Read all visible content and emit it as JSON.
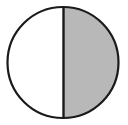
{
  "figure": {
    "kind": "geometry-diagram",
    "name": "circle-half-shaded",
    "description": "A circle divided by a vertical diameter into two equal halves; the right half is shaded gray and the left half is unshaded white.",
    "canvas": {
      "width": 128,
      "height": 125,
      "background_color": "#ffffff"
    },
    "circle": {
      "center_x": 63,
      "center_y": 62.5,
      "radius": 55.5,
      "diameter": 111,
      "outline_color": "#1a1a1a",
      "outline_width": 2.2,
      "fill_color": "#ffffff"
    },
    "divider": {
      "orientation": "vertical",
      "x": 63.5,
      "y_top": 7,
      "y_bottom": 118,
      "color": "#1a1a1a",
      "width": 2.4
    },
    "regions": [
      {
        "label": "left half",
        "position": "left",
        "shaded": "no",
        "fill_color": "#ffffff",
        "fraction": "1/2"
      },
      {
        "label": "right half",
        "position": "right",
        "shaded": "yes",
        "fill_color": "#b8b8b8",
        "fraction": "1/2"
      }
    ],
    "shaded_fraction": "1/2",
    "total_parts": 2,
    "shaded_parts": 1
  }
}
